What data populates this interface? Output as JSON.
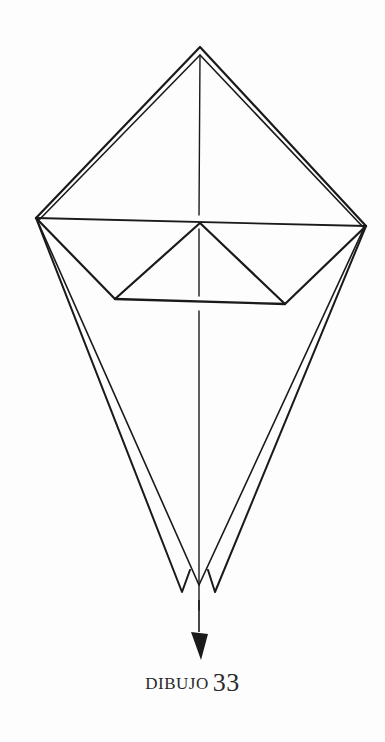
{
  "figure": {
    "label_word": "DIBUJO",
    "label_number": "33",
    "stroke_color": "#1a1a1a",
    "background_color": "#fdfdfd"
  },
  "diagram": {
    "points": {
      "top_apex": [
        200,
        47
      ],
      "left_corner": [
        36,
        218
      ],
      "right_corner": [
        366,
        226
      ],
      "inner_apex": [
        200,
        223
      ],
      "inner_base_left": [
        115,
        299
      ],
      "inner_base_right": [
        285,
        304
      ],
      "bottom_left_tip": [
        185,
        592
      ],
      "bottom_right_tip": [
        213,
        592
      ],
      "bottom_center": [
        199,
        582
      ],
      "arrow_tip": [
        200,
        657
      ]
    }
  }
}
